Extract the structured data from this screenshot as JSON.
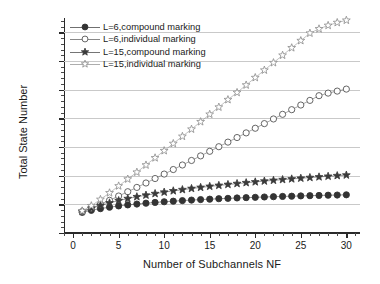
{
  "chart_data": {
    "type": "line",
    "title": "",
    "xlabel": "Number of Subchannels NF",
    "ylabel": "Total State Number",
    "xlim": [
      -1,
      31.5
    ],
    "ylim": [
      -2,
      35.5
    ],
    "yscale": "log",
    "grid": "horizontal-major",
    "legend_position": "upper-left-inside",
    "x_ticks": [
      0,
      5,
      10,
      15,
      20,
      25,
      30
    ],
    "x_tick_labels": [
      "0",
      "5",
      "10",
      "15",
      "20",
      "25",
      "30"
    ],
    "y_ticks_exponents": [
      -2,
      3,
      8,
      13,
      18,
      23,
      28,
      33
    ],
    "y_tick_labels": [
      "10-2",
      "103",
      "108",
      "1013",
      "1018",
      "1023",
      "1028",
      "1033"
    ],
    "x": [
      1,
      2,
      3,
      4,
      5,
      6,
      7,
      8,
      9,
      10,
      11,
      12,
      13,
      14,
      15,
      16,
      17,
      18,
      19,
      20,
      21,
      22,
      23,
      24,
      25,
      26,
      27,
      28,
      29,
      30
    ],
    "series": [
      {
        "name": "L=6,compound marking",
        "marker": "filled-circle",
        "color": "#333333",
        "log10_values": [
          1.6,
          1.95,
          2.25,
          2.5,
          2.72,
          2.9,
          3.05,
          3.2,
          3.33,
          3.45,
          3.55,
          3.65,
          3.74,
          3.83,
          3.9,
          3.98,
          4.04,
          4.11,
          4.17,
          4.22,
          4.28,
          4.33,
          4.38,
          4.42,
          4.47,
          4.51,
          4.55,
          4.59,
          4.62,
          4.66
        ]
      },
      {
        "name": "L=6,individual marking",
        "marker": "open-circle",
        "color": "#555555",
        "log10_values": [
          1.75,
          2.35,
          3.0,
          3.7,
          4.45,
          5.2,
          5.95,
          6.72,
          7.5,
          8.28,
          9.07,
          9.86,
          10.65,
          11.45,
          12.25,
          13.05,
          13.85,
          14.65,
          15.46,
          16.27,
          17.08,
          17.89,
          18.7,
          19.51,
          20.32,
          21.13,
          21.95,
          22.4,
          22.75,
          23.1
        ]
      },
      {
        "name": "L=15,compound marking",
        "marker": "filled-star",
        "color": "#3a3a3a",
        "log10_values": [
          1.75,
          2.3,
          2.8,
          3.25,
          3.65,
          4.0,
          4.32,
          4.6,
          4.87,
          5.12,
          5.35,
          5.56,
          5.76,
          5.95,
          6.13,
          6.3,
          6.46,
          6.62,
          6.77,
          6.91,
          7.05,
          7.18,
          7.31,
          7.43,
          7.55,
          7.67,
          7.78,
          7.89,
          8.0,
          8.1
        ]
      },
      {
        "name": "L=15,individual marking",
        "marker": "open-star",
        "color": "#8a8a8a",
        "log10_values": [
          1.85,
          2.75,
          3.85,
          5.0,
          6.2,
          7.4,
          8.6,
          9.85,
          11.1,
          12.35,
          13.6,
          14.85,
          16.1,
          17.4,
          18.7,
          19.95,
          21.25,
          22.5,
          23.8,
          25.1,
          26.4,
          27.7,
          29.0,
          30.3,
          31.55,
          32.85,
          33.6,
          34.2,
          34.7,
          35.1
        ]
      }
    ]
  },
  "legend": {
    "items": [
      {
        "label": "L=6,compound marking",
        "marker": "filled-circle",
        "color": "#333333"
      },
      {
        "label": "L=6,individual marking",
        "marker": "open-circle",
        "color": "#555555"
      },
      {
        "label": "L=15,compound marking",
        "marker": "filled-star",
        "color": "#3a3a3a"
      },
      {
        "label": "L=15,individual marking",
        "marker": "open-star",
        "color": "#8a8a8a"
      }
    ]
  }
}
